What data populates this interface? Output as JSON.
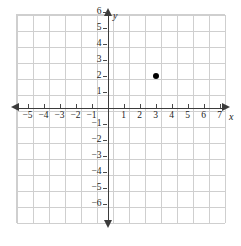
{
  "chart_data": {
    "type": "scatter",
    "title": "",
    "xlabel": "x",
    "ylabel": "y",
    "grid": true,
    "legend": false,
    "xlim": [
      -6,
      7.5
    ],
    "ylim": [
      -6.5,
      7
    ],
    "x_tick_labels": [
      "−5",
      "−4",
      "−3",
      "−2",
      "−1",
      "1",
      "2",
      "3",
      "4",
      "5",
      "6",
      "7"
    ],
    "x_tick_values": [
      -5,
      -4,
      -3,
      -2,
      -1,
      1,
      2,
      3,
      4,
      5,
      6,
      7
    ],
    "y_tick_labels": [
      "6",
      "5",
      "4",
      "3",
      "2",
      "1",
      "−1",
      "−2",
      "−3",
      "−4",
      "−5",
      "−6"
    ],
    "y_tick_values": [
      6,
      5,
      4,
      3,
      2,
      1,
      -1,
      -2,
      -3,
      -4,
      -5,
      -6
    ],
    "points": [
      {
        "x": 3,
        "y": 2,
        "label": ""
      }
    ],
    "point_color": "#000000",
    "axis_color": "#3b3b3b",
    "grid_color": "#cfcfcf",
    "background_color": "#ffffff"
  },
  "axes": {
    "x_name": "x",
    "y_name": "y"
  }
}
